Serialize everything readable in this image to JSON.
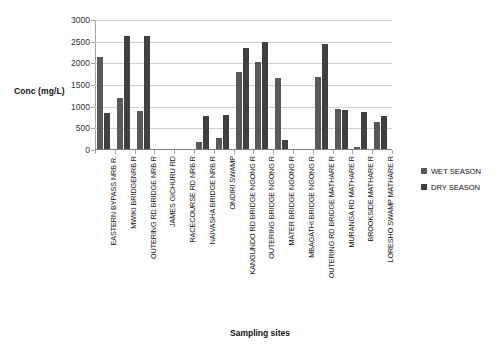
{
  "chart_data": {
    "type": "bar",
    "title": "",
    "xlabel": "Sampling sites",
    "ylabel": "Conc (mg/L)",
    "ylim": [
      0,
      3000
    ],
    "ytick_step": 500,
    "yticks": [
      0,
      500,
      1000,
      1500,
      2000,
      2500,
      3000
    ],
    "ytick_labels": [
      "0",
      "500",
      "1000",
      "1500",
      "2000",
      "2500",
      "3000"
    ],
    "grid": true,
    "grid_axis": "y",
    "legend_position": "right",
    "categories": [
      "EASTERN BYPASS NRB R.",
      "MWIKI BRIDGENRB R",
      "OUTERING RD BRIDGE NRB R",
      "JAMES GICHURU RD",
      "RACECOURSE RD NRB R",
      "NAIVASHA BRIDGE  NRB R",
      "ONDIRI SWAMP",
      "KANGUNDO RD BRIDGE NGONG R",
      "OUTERING BRIDGE NGONG R",
      "MATER BRIDGE NGONG R",
      "MBAGATHI BRIDGE NGONG R",
      "OUTERING RD BRIDGE MATHARE R",
      "MURANGA RD MATHARE R",
      "BROOKSIDE MATHARE R",
      "LORESHO SWAMP MATHARE R"
    ],
    "series": [
      {
        "name": "WET SEASON",
        "color": "#595959",
        "values": [
          2150,
          1190,
          890,
          0,
          0,
          190,
          280,
          1800,
          2030,
          1670,
          0,
          1680,
          950,
          60,
          640
        ]
      },
      {
        "name": "DRY SEASON",
        "color": "#404040",
        "values": [
          860,
          2640,
          2640,
          0,
          0,
          790,
          810,
          2350,
          2500,
          230,
          0,
          2440,
          920,
          880,
          790
        ]
      }
    ]
  },
  "legend": {
    "items": [
      {
        "label": "WET SEASON",
        "color": "#595959"
      },
      {
        "label": "DRY SEASON",
        "color": "#404040"
      }
    ]
  }
}
